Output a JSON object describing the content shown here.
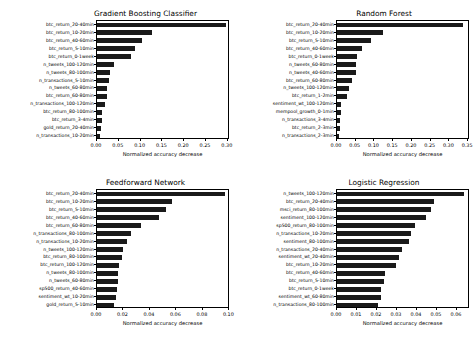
{
  "figure": {
    "background": "#ffffff",
    "bar_color": "#1a1a1a",
    "axis_color": "#000000"
  },
  "chart_data": [
    {
      "type": "bar",
      "orientation": "horizontal",
      "title": "Gradient Boosting Classifier",
      "xlabel": "Normalized accuracy decrease",
      "ylabel": "",
      "xlim": [
        0.0,
        0.305
      ],
      "xticks": [
        0.0,
        0.05,
        0.1,
        0.15,
        0.2,
        0.25,
        0.3
      ],
      "xticklabels": [
        "0.00",
        "0.05",
        "0.10",
        "0.15",
        "0.20",
        "0.25",
        "0.30"
      ],
      "grid": false,
      "legend": false,
      "categories": [
        "btc_return_20-40min",
        "btc_return_10-20min",
        "btc_return_40-60min",
        "btc_return_5-10min",
        "btc_return_0-1week",
        "n_tweets_100-120min",
        "n_tweets_80-100min",
        "n_transactions_5-10min",
        "n_tweets_60-80min",
        "btc_return_60-80min",
        "n_transactions_100-120min",
        "btc_return_80-100min",
        "btc_return_3-4min",
        "gold_return_20-40min",
        "n_transactions_10-20min"
      ],
      "values": [
        0.295,
        0.125,
        0.103,
        0.086,
        0.077,
        0.038,
        0.029,
        0.027,
        0.024,
        0.022,
        0.018,
        0.012,
        0.011,
        0.01,
        0.008
      ]
    },
    {
      "type": "bar",
      "orientation": "horizontal",
      "title": "Random Forest",
      "xlabel": "Normalized accuracy decrease",
      "ylabel": "",
      "xlim": [
        0.0,
        0.355
      ],
      "xticks": [
        0.0,
        0.05,
        0.1,
        0.15,
        0.2,
        0.25,
        0.3,
        0.35
      ],
      "xticklabels": [
        "0.00",
        "0.05",
        "0.10",
        "0.15",
        "0.20",
        "0.25",
        "0.30",
        "0.35"
      ],
      "grid": false,
      "legend": false,
      "categories": [
        "btc_return_20-40min",
        "btc_return_10-20min",
        "btc_return_5-10min",
        "btc_return_40-60min",
        "btc_return_0-1week",
        "n_tweets_60-80min",
        "n_tweets_40-60min",
        "btc_return_60-80min",
        "n_tweets_100-120min",
        "btc_return_1-2min",
        "sentiment_wt_100-120min",
        "mempool_growth_0-1min",
        "n_transactions_3-4min",
        "btc_return_2-3min",
        "n_transactions_2-3min"
      ],
      "values": [
        0.335,
        0.124,
        0.092,
        0.067,
        0.053,
        0.051,
        0.051,
        0.04,
        0.032,
        0.026,
        0.012,
        0.011,
        0.008,
        0.007,
        0.006
      ]
    },
    {
      "type": "bar",
      "orientation": "horizontal",
      "title": "Feedforward Network",
      "xlabel": "Normalized accuracy decrease",
      "ylabel": "",
      "xlim": [
        0.0,
        0.1005
      ],
      "xticks": [
        0.0,
        0.02,
        0.04,
        0.06,
        0.08,
        0.1
      ],
      "xticklabels": [
        "0.00",
        "0.02",
        "0.04",
        "0.06",
        "0.08",
        "0.10"
      ],
      "grid": false,
      "legend": false,
      "categories": [
        "btc_return_20-40min",
        "btc_return_10-20min",
        "btc_return_5-10min",
        "btc_return_40-60min",
        "btc_return_60-80min",
        "n_transactions_80-100min",
        "n_transactions_10-20min",
        "n_tweets_100-120min",
        "btc_return_80-100min",
        "btc_return_100-120min",
        "n_tweets_80-100min",
        "n_tweets_60-80min",
        "sp500_return_40-60min",
        "sentiment_wt_10-20min",
        "gold_return_5-10min"
      ],
      "values": [
        0.097,
        0.057,
        0.052,
        0.047,
        0.033,
        0.026,
        0.023,
        0.02,
        0.019,
        0.017,
        0.016,
        0.0155,
        0.0148,
        0.014,
        0.013
      ]
    },
    {
      "type": "bar",
      "orientation": "horizontal",
      "title": "Logistic Regression",
      "xlabel": "Normalized accuracy decrease",
      "ylabel": "",
      "xlim": [
        0.0,
        0.0665
      ],
      "xticks": [
        0.0,
        0.01,
        0.02,
        0.03,
        0.04,
        0.05,
        0.06
      ],
      "xticklabels": [
        "0.00",
        "0.01",
        "0.02",
        "0.03",
        "0.04",
        "0.05",
        "0.06"
      ],
      "grid": false,
      "legend": false,
      "categories": [
        "n_tweets_100-120min",
        "btc_return_20-40min",
        "msci_return_80-100min",
        "sentiment_100-120min",
        "sp500_return_80-100min",
        "n_transactions_10-20min",
        "sentiment_80-100min",
        "n_transactions_20-40min",
        "sentiment_wt_20-40min",
        "btc_return_10-20min",
        "btc_return_40-60min",
        "btc_return_5-10min",
        "btc_return_0-1week",
        "sentiment_wt_60-80min",
        "n_transactions_80-100min"
      ],
      "values": [
        0.0635,
        0.0483,
        0.047,
        0.0447,
        0.0392,
        0.0372,
        0.0358,
        0.0325,
        0.031,
        0.0295,
        0.0242,
        0.0235,
        0.0222,
        0.0218,
        0.0205
      ]
    }
  ]
}
